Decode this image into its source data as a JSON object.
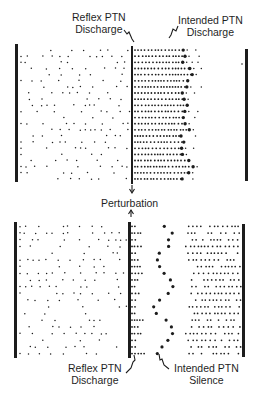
{
  "labels": {
    "top_left_line1": "Reflex PTN",
    "top_left_line2": "Discharge",
    "top_right_line1": "Intended PTN",
    "top_right_line2": "Discharge",
    "middle": "Perturbation",
    "bottom_left_line1": "Reflex PTN",
    "bottom_left_line2": "Discharge",
    "bottom_right_line1": "Intended PTN",
    "bottom_right_line2": "Silence"
  },
  "colors": {
    "ink": "#1c1c1c",
    "background": "#ffffff"
  },
  "panels": [
    {
      "name": "top-raster",
      "left_bar_x": 16,
      "mid_bar_x": 132,
      "right_bar_x": 246,
      "y_top": 47,
      "y_bottom": 182,
      "rows": 22,
      "condition": "intended discharge"
    },
    {
      "name": "bottom-raster",
      "left_bar_x": 15,
      "mid_bar_x": 129,
      "right_bar_x": 243,
      "y_top": 223,
      "y_bottom": 357,
      "rows": 20,
      "condition": "intended silence"
    }
  ]
}
